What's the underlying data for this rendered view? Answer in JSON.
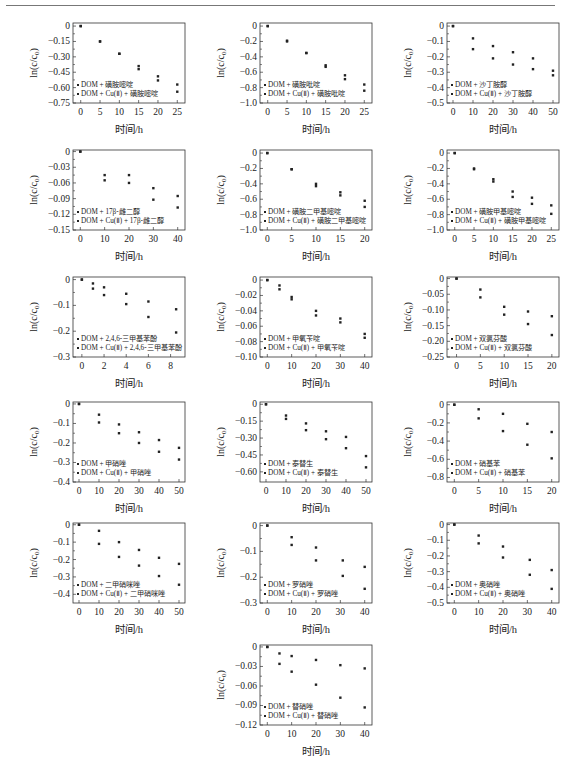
{
  "chart_data": [
    {
      "id": "p1",
      "type": "scatter",
      "xlabel": "时间/h",
      "ylabel": "ln(c/c0)",
      "xticks": [
        0,
        5,
        10,
        15,
        20,
        25
      ],
      "xlim": [
        -2,
        27
      ],
      "yticks": [
        0,
        -0.15,
        -0.3,
        -0.45,
        -0.6,
        -0.75
      ],
      "ytick_labels": [
        "0",
        "-0.15",
        "-0.30",
        "-0.45",
        "-0.60",
        "-0.75"
      ],
      "ylim": [
        -0.75,
        0.03
      ],
      "legend": [
        "DOM + 磺胺嘧啶",
        "DOM + Cu(Ⅱ) + 磺胺嘧啶"
      ],
      "series": [
        {
          "name": "DOM + 磺胺嘧啶",
          "x": [
            0,
            5,
            10,
            15,
            20,
            25
          ],
          "y": [
            0,
            -0.15,
            -0.27,
            -0.39,
            -0.49,
            -0.57
          ]
        },
        {
          "name": "DOM + Cu(Ⅱ) + 磺胺嘧啶",
          "x": [
            0,
            5,
            10,
            15,
            20,
            25
          ],
          "y": [
            0,
            -0.15,
            -0.27,
            -0.42,
            -0.53,
            -0.64
          ]
        }
      ]
    },
    {
      "id": "p2",
      "type": "scatter",
      "xlabel": "时间/h",
      "ylabel": "ln(c/c0)",
      "xticks": [
        0,
        5,
        10,
        15,
        20,
        25
      ],
      "xlim": [
        -2,
        27
      ],
      "yticks": [
        0,
        -0.2,
        -0.4,
        -0.6,
        -0.8,
        -1.0
      ],
      "ytick_labels": [
        "0",
        "-0.2",
        "-0.4",
        "-0.6",
        "-0.8",
        "-1.0"
      ],
      "ylim": [
        -1.0,
        0.04
      ],
      "legend": [
        "DOM + 磺胺吡啶",
        "DOM + Cu(Ⅱ) + 磺胺吡啶"
      ],
      "series": [
        {
          "name": "DOM + 磺胺吡啶",
          "x": [
            0,
            5,
            10,
            15,
            20,
            25
          ],
          "y": [
            0,
            -0.19,
            -0.35,
            -0.51,
            -0.64,
            -0.76
          ]
        },
        {
          "name": "DOM + Cu(Ⅱ) + 磺胺吡啶",
          "x": [
            0,
            5,
            10,
            15,
            20,
            25
          ],
          "y": [
            0,
            -0.2,
            -0.35,
            -0.53,
            -0.69,
            -0.84
          ]
        }
      ]
    },
    {
      "id": "p3",
      "type": "scatter",
      "xlabel": "时间/h",
      "ylabel": "ln(c/c0)",
      "xticks": [
        0,
        10,
        20,
        30,
        40,
        50
      ],
      "xlim": [
        -3,
        53
      ],
      "yticks": [
        0,
        -0.1,
        -0.2,
        -0.3,
        -0.4,
        -0.5
      ],
      "ytick_labels": [
        "0",
        "-0.1",
        "-0.2",
        "-0.3",
        "-0.4",
        "-0.5"
      ],
      "ylim": [
        -0.5,
        0.02
      ],
      "legend": [
        "DOM + 沙丁胺醇",
        "DOM + Cu(Ⅱ) + 沙丁胺醇"
      ],
      "series": [
        {
          "name": "DOM + 沙丁胺醇",
          "x": [
            0,
            10,
            20,
            30,
            40,
            50
          ],
          "y": [
            0,
            -0.08,
            -0.13,
            -0.17,
            -0.21,
            -0.29
          ]
        },
        {
          "name": "DOM + Cu(Ⅱ) + 沙丁胺醇",
          "x": [
            0,
            10,
            20,
            30,
            40,
            50
          ],
          "y": [
            0,
            -0.15,
            -0.21,
            -0.25,
            -0.28,
            -0.32
          ]
        }
      ]
    },
    {
      "id": "p4",
      "type": "scatter",
      "xlabel": "时间/h",
      "ylabel": "ln(c/c0)",
      "xticks": [
        0,
        10,
        20,
        30,
        40
      ],
      "xlim": [
        -3,
        43
      ],
      "yticks": [
        0,
        -0.03,
        -0.06,
        -0.09,
        -0.12,
        -0.15
      ],
      "ytick_labels": [
        "0",
        "-0.03",
        "-0.06",
        "-0.09",
        "-0.12",
        "-0.15"
      ],
      "ylim": [
        -0.15,
        0.003
      ],
      "legend": [
        "DOM + 17β-雌二醇",
        "DOM + Cu(Ⅱ) + 17β-雌二醇"
      ],
      "series": [
        {
          "name": "DOM + 17β-雌二醇",
          "x": [
            0,
            10,
            20,
            30,
            40
          ],
          "y": [
            0,
            -0.045,
            -0.045,
            -0.07,
            -0.085
          ]
        },
        {
          "name": "DOM + Cu(Ⅱ) + 17β-雌二醇",
          "x": [
            0,
            10,
            20,
            30,
            40
          ],
          "y": [
            0,
            -0.055,
            -0.06,
            -0.092,
            -0.107
          ]
        }
      ]
    },
    {
      "id": "p5",
      "type": "scatter",
      "xlabel": "时间/h",
      "ylabel": "ln(c/c0)",
      "xticks": [
        0,
        5,
        10,
        15,
        20
      ],
      "xlim": [
        -1.5,
        21.5
      ],
      "yticks": [
        0,
        -0.2,
        -0.4,
        -0.6,
        -0.8,
        -1.0
      ],
      "ytick_labels": [
        "0",
        "-0.2",
        "-0.4",
        "-0.6",
        "-0.8",
        "-1.0"
      ],
      "ylim": [
        -1.0,
        0.04
      ],
      "legend": [
        "DOM + 磺胺二甲基嘧啶",
        "DOM + Cu(Ⅱ) + 磺胺二甲基嘧啶"
      ],
      "series": [
        {
          "name": "DOM + 磺胺二甲基嘧啶",
          "x": [
            0,
            5,
            10,
            15,
            20
          ],
          "y": [
            0,
            -0.21,
            -0.4,
            -0.51,
            -0.62
          ]
        },
        {
          "name": "DOM + Cu(Ⅱ) + 磺胺二甲基嘧啶",
          "x": [
            0,
            5,
            10,
            15,
            20
          ],
          "y": [
            0,
            -0.21,
            -0.43,
            -0.55,
            -0.7
          ]
        }
      ]
    },
    {
      "id": "p6",
      "type": "scatter",
      "xlabel": "时间/h",
      "ylabel": "ln(c/c0)",
      "xticks": [
        0,
        5,
        10,
        15,
        20,
        25
      ],
      "xlim": [
        -2,
        27
      ],
      "yticks": [
        0,
        -0.2,
        -0.4,
        -0.6,
        -0.8,
        -1.0
      ],
      "ytick_labels": [
        "0",
        "-0.2",
        "-0.4",
        "-0.6",
        "-0.8",
        "-1.0"
      ],
      "ylim": [
        -1.0,
        0.04
      ],
      "legend": [
        "DOM + 磺胺甲基嘧啶",
        "DOM + Cu(Ⅱ) + 磺胺甲基嘧啶"
      ],
      "series": [
        {
          "name": "DOM + 磺胺甲基嘧啶",
          "x": [
            0,
            5,
            10,
            15,
            20,
            25
          ],
          "y": [
            0,
            -0.2,
            -0.34,
            -0.5,
            -0.58,
            -0.68
          ]
        },
        {
          "name": "DOM + Cu(Ⅱ) + 磺胺甲基嘧啶",
          "x": [
            0,
            5,
            10,
            15,
            20,
            25
          ],
          "y": [
            0,
            -0.21,
            -0.37,
            -0.57,
            -0.66,
            -0.79
          ]
        }
      ]
    },
    {
      "id": "p7",
      "type": "scatter",
      "xlabel": "时间/h",
      "ylabel": "ln(c/c0)",
      "xticks": [
        0,
        2,
        4,
        6,
        8
      ],
      "xlim": [
        -0.8,
        9.3
      ],
      "yticks": [
        0,
        -0.1,
        -0.2,
        -0.3
      ],
      "ytick_labels": [
        "0",
        "-0.1",
        "-0.2",
        "-0.3"
      ],
      "ylim": [
        -0.3,
        0.01
      ],
      "legend": [
        "DOM + 2,4,6-三甲基苯酚",
        "DOM + Cu(Ⅱ) + 2,4,6-三甲基苯酚"
      ],
      "series": [
        {
          "name": "DOM + 2,4,6-三甲基苯酚",
          "x": [
            0,
            1,
            2,
            4,
            6,
            8.5
          ],
          "y": [
            0,
            -0.015,
            -0.03,
            -0.055,
            -0.085,
            -0.115
          ]
        },
        {
          "name": "DOM + Cu(Ⅱ) + 2,4,6-三甲基苯酚",
          "x": [
            0,
            1,
            2,
            4,
            6,
            8.5
          ],
          "y": [
            0,
            -0.035,
            -0.06,
            -0.095,
            -0.145,
            -0.205
          ]
        }
      ]
    },
    {
      "id": "p8",
      "type": "scatter",
      "xlabel": "时间/h",
      "ylabel": "ln(c/c0)",
      "xticks": [
        0,
        10,
        20,
        30,
        40
      ],
      "xlim": [
        -3,
        43
      ],
      "yticks": [
        0,
        -0.02,
        -0.04,
        -0.06,
        -0.08,
        -0.1
      ],
      "ytick_labels": [
        "0",
        "-0.02",
        "-0.04",
        "-0.06",
        "-0.08",
        "-0.10"
      ],
      "ylim": [
        -0.1,
        0.004
      ],
      "legend": [
        "DOM + 甲氧苄啶",
        "DOM + Cu(Ⅱ) + 甲氧苄啶"
      ],
      "series": [
        {
          "name": "DOM + 甲氧苄啶",
          "x": [
            0,
            5,
            10,
            20,
            30,
            40
          ],
          "y": [
            0,
            -0.007,
            -0.022,
            -0.04,
            -0.05,
            -0.07
          ]
        },
        {
          "name": "DOM + Cu(Ⅱ) + 甲氧苄啶",
          "x": [
            0,
            5,
            10,
            20,
            30,
            40
          ],
          "y": [
            0,
            -0.012,
            -0.025,
            -0.046,
            -0.055,
            -0.075
          ]
        }
      ]
    },
    {
      "id": "p9",
      "type": "scatter",
      "xlabel": "时间/h",
      "ylabel": "ln(c/c0)",
      "xticks": [
        0,
        5,
        10,
        15,
        20
      ],
      "xlim": [
        -2,
        21.5
      ],
      "yticks": [
        0,
        -0.05,
        -0.1,
        -0.15,
        -0.2,
        -0.25
      ],
      "ytick_labels": [
        "0",
        "-0.05",
        "-0.10",
        "-0.15",
        "-0.20",
        "-0.25"
      ],
      "ylim": [
        -0.25,
        0.005
      ],
      "legend": [
        "DOM + 双氯芬酸",
        "DOM + Cu(Ⅱ) + 双氯芬酸"
      ],
      "series": [
        {
          "name": "DOM + 双氯芬酸",
          "x": [
            0,
            5,
            10,
            15,
            20
          ],
          "y": [
            0,
            -0.035,
            -0.09,
            -0.105,
            -0.12
          ]
        },
        {
          "name": "DOM + Cu(Ⅱ) + 双氯芬酸",
          "x": [
            0,
            5,
            10,
            15,
            20
          ],
          "y": [
            0,
            -0.06,
            -0.115,
            -0.145,
            -0.18
          ]
        }
      ]
    },
    {
      "id": "p10",
      "type": "scatter",
      "xlabel": "时间/h",
      "ylabel": "ln(c/c0)",
      "xticks": [
        0,
        10,
        20,
        30,
        40,
        50
      ],
      "xlim": [
        -3,
        53
      ],
      "yticks": [
        0,
        -0.1,
        -0.2,
        -0.3,
        -0.4
      ],
      "ytick_labels": [
        "0",
        "-0.1",
        "-0.2",
        "-0.3",
        "-0.4"
      ],
      "ylim": [
        -0.4,
        0.01
      ],
      "legend": [
        "DOM + 甲硝唑",
        "DOM + Cu(Ⅱ) + 甲硝唑"
      ],
      "series": [
        {
          "name": "DOM + 甲硝唑",
          "x": [
            0,
            10,
            20,
            30,
            40,
            50
          ],
          "y": [
            0,
            -0.055,
            -0.105,
            -0.145,
            -0.185,
            -0.225
          ]
        },
        {
          "name": "DOM + Cu(Ⅱ) + 甲硝唑",
          "x": [
            0,
            10,
            20,
            30,
            40,
            50
          ],
          "y": [
            0,
            -0.095,
            -0.15,
            -0.2,
            -0.245,
            -0.285
          ]
        }
      ]
    },
    {
      "id": "p11",
      "type": "scatter",
      "xlabel": "时间/h",
      "ylabel": "ln(c/c0)",
      "xticks": [
        0,
        10,
        20,
        30,
        40,
        50
      ],
      "xlim": [
        -3,
        53
      ],
      "yticks": [
        0,
        -0.15,
        -0.3,
        -0.45,
        -0.6
      ],
      "ytick_labels": [
        "0",
        "-0.15",
        "-0.30",
        "-0.45",
        "-0.60"
      ],
      "ylim": [
        -0.69,
        0.02
      ],
      "legend": [
        "DOM + 泰替生",
        "DOM + Cu(Ⅱ) + 泰替生"
      ],
      "series": [
        {
          "name": "DOM + 泰替生",
          "x": [
            0,
            10,
            20,
            30,
            40,
            50
          ],
          "y": [
            0,
            -0.1,
            -0.17,
            -0.24,
            -0.29,
            -0.46
          ]
        },
        {
          "name": "DOM + Cu(Ⅱ) + 泰替生",
          "x": [
            0,
            10,
            20,
            30,
            40,
            50
          ],
          "y": [
            0,
            -0.13,
            -0.23,
            -0.31,
            -0.39,
            -0.56
          ]
        }
      ]
    },
    {
      "id": "p12",
      "type": "scatter",
      "xlabel": "时间/h",
      "ylabel": "ln(c/c0)",
      "xticks": [
        0,
        5,
        10,
        15,
        20
      ],
      "xlim": [
        -1.5,
        21.5
      ],
      "yticks": [
        0,
        -0.2,
        -0.4,
        -0.6,
        -0.8
      ],
      "ytick_labels": [
        "0",
        "-0.2",
        "-0.4",
        "-0.6",
        "-0.8"
      ],
      "ylim": [
        -0.85,
        0.03
      ],
      "legend": [
        "DOM + 硝基苯",
        "DOM + Cu(Ⅱ) + 硝基苯"
      ],
      "series": [
        {
          "name": "DOM + 硝基苯",
          "x": [
            0,
            5,
            10,
            15,
            20
          ],
          "y": [
            0,
            -0.05,
            -0.1,
            -0.21,
            -0.3
          ]
        },
        {
          "name": "DOM + Cu(Ⅱ) + 硝基苯",
          "x": [
            0,
            5,
            10,
            15,
            20
          ],
          "y": [
            0,
            -0.15,
            -0.29,
            -0.44,
            -0.59
          ]
        }
      ]
    },
    {
      "id": "p13",
      "type": "scatter",
      "xlabel": "时间/h",
      "ylabel": "ln(c/c0)",
      "xticks": [
        0,
        10,
        20,
        30,
        40,
        50
      ],
      "xlim": [
        -3,
        53
      ],
      "yticks": [
        0,
        -0.1,
        -0.2,
        -0.3,
        -0.4
      ],
      "ytick_labels": [
        "0",
        "-0.1",
        "-0.2",
        "-0.3",
        "-0.4"
      ],
      "ylim": [
        -0.45,
        0.01
      ],
      "legend": [
        "DOM + 二甲硝咪唑",
        "DOM + Cu(Ⅱ) + 二甲硝咪唑"
      ],
      "series": [
        {
          "name": "DOM + 二甲硝咪唑",
          "x": [
            0,
            10,
            20,
            30,
            40,
            50
          ],
          "y": [
            0,
            -0.035,
            -0.1,
            -0.145,
            -0.19,
            -0.225
          ]
        },
        {
          "name": "DOM + Cu(Ⅱ) + 二甲硝咪唑",
          "x": [
            0,
            10,
            20,
            30,
            40,
            50
          ],
          "y": [
            0,
            -0.11,
            -0.185,
            -0.235,
            -0.295,
            -0.345
          ]
        }
      ]
    },
    {
      "id": "p14",
      "type": "scatter",
      "xlabel": "时间/h",
      "ylabel": "ln(c/c0)",
      "xticks": [
        0,
        10,
        20,
        30,
        40
      ],
      "xlim": [
        -3,
        43
      ],
      "yticks": [
        0,
        -0.1,
        -0.2,
        -0.3
      ],
      "ytick_labels": [
        "0",
        "-0.1",
        "-0.2",
        "-0.3"
      ],
      "ylim": [
        -0.3,
        0.01
      ],
      "legend": [
        "DOM + 罗硝唑",
        "DOM + Cu(Ⅱ) + 罗硝唑"
      ],
      "series": [
        {
          "name": "DOM + 罗硝唑",
          "x": [
            0,
            10,
            20,
            31,
            40
          ],
          "y": [
            0,
            -0.045,
            -0.085,
            -0.135,
            -0.16
          ]
        },
        {
          "name": "DOM + Cu(Ⅱ) + 罗硝唑",
          "x": [
            0,
            10,
            20,
            31,
            40
          ],
          "y": [
            0,
            -0.075,
            -0.135,
            -0.195,
            -0.245
          ]
        }
      ]
    },
    {
      "id": "p15",
      "type": "scatter",
      "xlabel": "时间/h",
      "ylabel": "ln(c/c0)",
      "xticks": [
        0,
        10,
        20,
        30,
        40
      ],
      "xlim": [
        -3,
        43
      ],
      "yticks": [
        0,
        -0.1,
        -0.2,
        -0.3,
        -0.4,
        -0.5
      ],
      "ytick_labels": [
        "0",
        "-0.1",
        "-0.2",
        "-0.3",
        "-0.4",
        "-0.5"
      ],
      "ylim": [
        -0.5,
        0.01
      ],
      "legend": [
        "DOM + 奥硝唑",
        "DOM + Cu(Ⅱ) + 奥硝唑"
      ],
      "series": [
        {
          "name": "DOM + 奥硝唑",
          "x": [
            0,
            10,
            20,
            31,
            40
          ],
          "y": [
            0,
            -0.07,
            -0.14,
            -0.225,
            -0.29
          ]
        },
        {
          "name": "DOM + Cu(Ⅱ) + 奥硝唑",
          "x": [
            0,
            10,
            20,
            31,
            40
          ],
          "y": [
            0,
            -0.12,
            -0.21,
            -0.32,
            -0.41
          ]
        }
      ]
    },
    {
      "id": "p16",
      "type": "scatter",
      "xlabel": "时间/h",
      "ylabel": "ln(c/c0)",
      "xticks": [
        0,
        10,
        20,
        30,
        40
      ],
      "xlim": [
        -3,
        43
      ],
      "yticks": [
        0,
        -0.03,
        -0.06,
        -0.09,
        -0.12
      ],
      "ytick_labels": [
        "0",
        "-0.03",
        "-0.06",
        "-0.09",
        "-0.12"
      ],
      "ylim": [
        -0.12,
        0.003
      ],
      "legend": [
        "DOM + 替硝唑",
        "DOM + Cu(Ⅱ) + 替硝唑"
      ],
      "series": [
        {
          "name": "DOM + 替硝唑",
          "x": [
            0,
            5,
            10,
            20,
            30,
            40
          ],
          "y": [
            0,
            -0.01,
            -0.014,
            -0.02,
            -0.028,
            -0.033
          ]
        },
        {
          "name": "DOM + Cu(Ⅱ) + 替硝唑",
          "x": [
            0,
            5,
            10,
            20,
            30,
            40
          ],
          "y": [
            0,
            -0.026,
            -0.038,
            -0.058,
            -0.078,
            -0.093
          ]
        }
      ]
    }
  ]
}
